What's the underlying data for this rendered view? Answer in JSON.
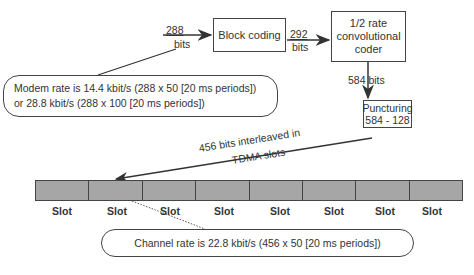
{
  "blocks": {
    "input_bits": {
      "num": "288",
      "unit": "bits"
    },
    "block_coding": "Block coding",
    "mid_bits": {
      "num": "292",
      "unit": "bits"
    },
    "conv_coder": [
      "1/2 rate",
      "convolutional",
      "coder"
    ],
    "out_bits": "584 bits",
    "puncturing": [
      "Puncturing",
      "584 - 128"
    ],
    "interleave": [
      "456 bits  interleaved in",
      "TDMA slots"
    ]
  },
  "modem_note": [
    "Modem rate is 14.4 kbit/s (288 x 50 [20 ms periods])",
    "or 28.8 kbit/s (288 x 100 [20 ms periods])"
  ],
  "channel_note": "Channel rate is 22.8 kbit/s (456 x 50 [20 ms periods])",
  "slots": [
    "Slot",
    "Slot",
    "Slot",
    "Slot",
    "Slot",
    "Slot",
    "Slot",
    "Slot"
  ],
  "colors": {
    "slot_fill": "#a6a6a6",
    "stroke": "#444444"
  }
}
